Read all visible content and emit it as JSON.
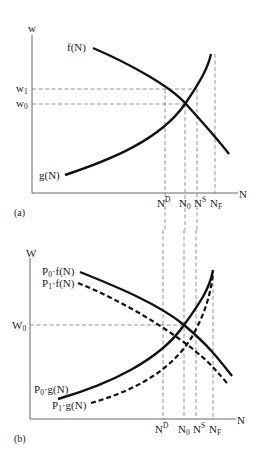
{
  "panel_a": {
    "panel_label": "(a)",
    "y_axis_label": "w",
    "x_axis_label": "N",
    "y_ticks": [
      {
        "base": "w",
        "sub": "1",
        "name": "w1"
      },
      {
        "base": "w",
        "sub": "0",
        "name": "w0"
      }
    ],
    "x_ticks": [
      {
        "base": "N",
        "sup": "D",
        "name": "N-D"
      },
      {
        "base": "N",
        "sub": "0",
        "name": "N0"
      },
      {
        "base": "N",
        "sup": "S",
        "name": "N-S"
      },
      {
        "base": "N",
        "sub": "F",
        "name": "N-F"
      }
    ],
    "curves": {
      "f": {
        "label": "f(N)",
        "style": "solid",
        "role": "demand (downward sloping)"
      },
      "g": {
        "label": "g(N)",
        "style": "solid",
        "role": "supply (upward sloping, asymptotic at N_F)"
      }
    }
  },
  "panel_b": {
    "panel_label": "(b)",
    "y_axis_label": "W",
    "x_axis_label": "N",
    "y_ticks": [
      {
        "base": "W",
        "sub": "0",
        "name": "W0"
      }
    ],
    "x_ticks": [
      {
        "base": "N",
        "sup": "D",
        "name": "N-D"
      },
      {
        "base": "N",
        "sub": "0",
        "name": "N0"
      },
      {
        "base": "N",
        "sup": "S",
        "name": "N-S"
      },
      {
        "base": "N",
        "sub": "F",
        "name": "N-F"
      }
    ],
    "curves": {
      "p0f": {
        "prefix": "P",
        "prefix_sub": "0",
        "rest": "·f(N)",
        "style": "solid"
      },
      "p1f": {
        "prefix": "P",
        "prefix_sub": "1",
        "rest": "·f(N)",
        "style": "dashed"
      },
      "p0g": {
        "prefix": "P",
        "prefix_sub": "0",
        "rest": "·g(N)",
        "style": "solid"
      },
      "p1g": {
        "prefix": "P",
        "prefix_sub": "1",
        "rest": "·g(N)",
        "style": "dashed"
      }
    }
  }
}
